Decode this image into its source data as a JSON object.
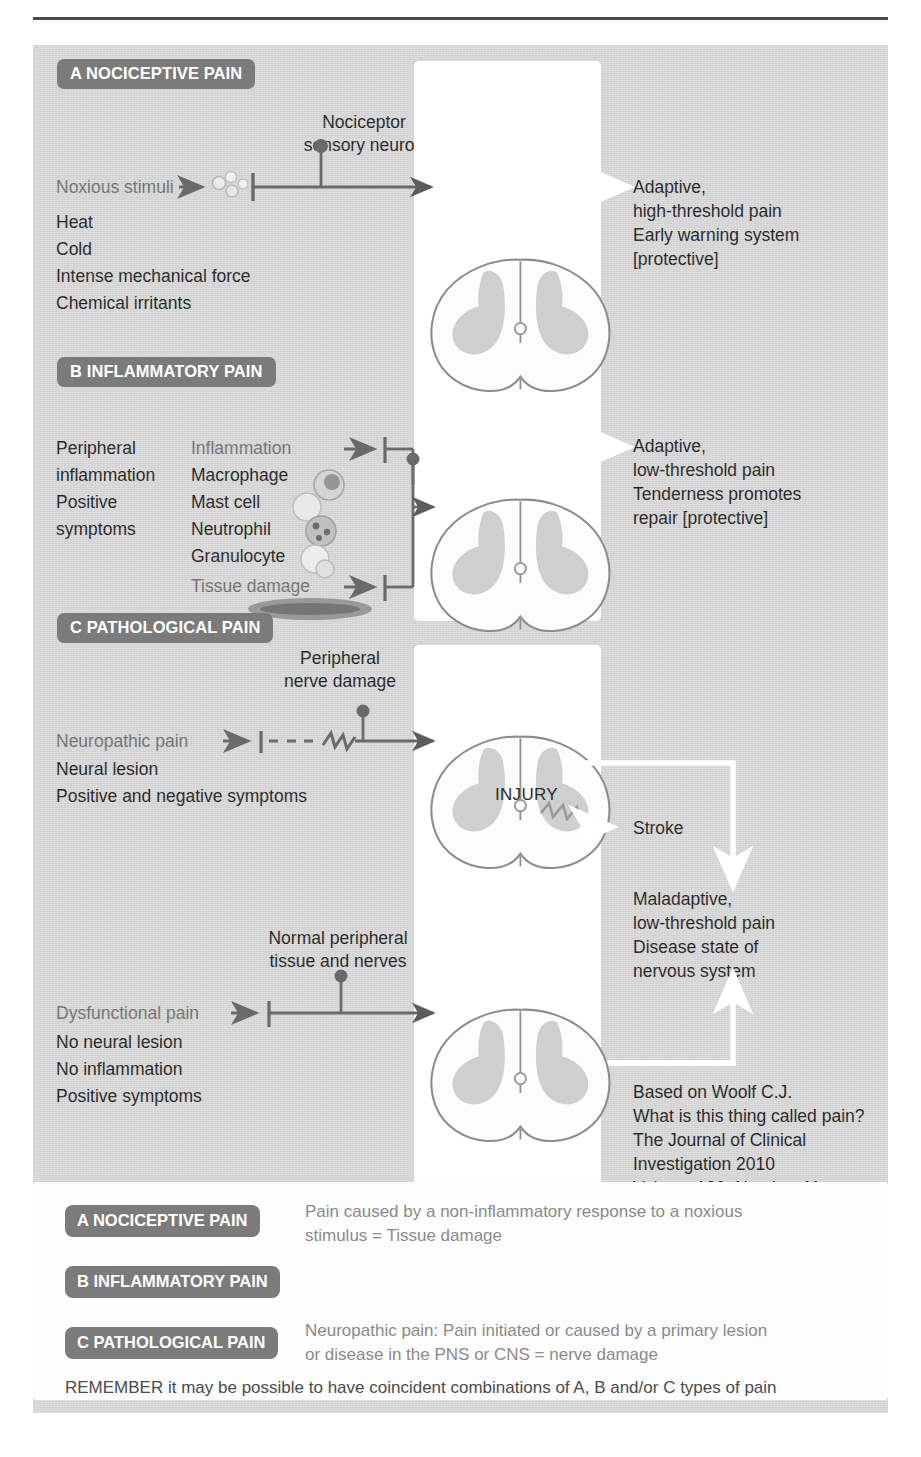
{
  "figure": {
    "title_caption": "Classification of pain mechanisms",
    "accent_pill_color": "#7b7b7b",
    "canvas_color": "#d8d8d8"
  },
  "sections": {
    "a": {
      "pill": "A NOCICEPTIVE PAIN",
      "stimulus_label": "Noxious stimuli",
      "neuron_label_line1": "Nociceptor",
      "neuron_label_line2": "sensory neuron",
      "stimuli_list": [
        "Heat",
        "Cold",
        "Intense mechanical force",
        "Chemical irritants"
      ],
      "cord_title": [
        "Pain",
        "Autonomic response",
        "Withdrawal reflex"
      ],
      "cord_caption": "Spinal cord",
      "outcome": [
        "Adaptive,",
        "high-threshold pain",
        "Early warning system",
        "[protective]"
      ]
    },
    "b": {
      "pill": "B INFLAMMATORY PAIN",
      "left_col": [
        "Peripheral",
        "inflammation",
        "Positive",
        "symptoms"
      ],
      "mid_col": [
        "Inflammation",
        "Macrophage",
        "Mast cell",
        "Neutrophil",
        "Granulocyte",
        "Tissue damage"
      ],
      "mid_col_grey_indices": [
        0,
        5
      ],
      "cord_title": [
        "Spontaneous pain",
        "Pain hypersensitivity"
      ],
      "outcome": [
        "Adaptive,",
        "low-threshold pain",
        "Tenderness promotes",
        "repair [protective]"
      ]
    },
    "c": {
      "pill": "C PATHOLOGICAL PAIN",
      "nerve_label_line1": "Peripheral",
      "nerve_label_line2": "nerve damage",
      "neuropathic_label": "Neuropathic pain",
      "neuropathic_list": [
        "Neural lesion",
        "Positive and negative symptoms"
      ],
      "cord_title": [
        "Spontaneous pain",
        "Pain hypersensitivity"
      ],
      "injury_label": "INJURY",
      "cord_caption": [
        "Abnormal control",
        "processing"
      ],
      "stroke_label": "Stroke",
      "outcome": [
        "Maladaptive,",
        "low-threshold pain",
        "Disease state of",
        "nervous system"
      ]
    },
    "d": {
      "normal_label_line1": "Normal peripheral",
      "normal_label_line2": "tissue and nerves",
      "dysfunctional_label": "Dysfunctional pain",
      "dysfunctional_list": [
        "No neural lesion",
        "No inflammation",
        "Positive symptoms"
      ],
      "cord_title": [
        "Spontaneous pain",
        "Pain hypersensitivity"
      ],
      "cord_caption": [
        "Abnormal control",
        "processing"
      ]
    }
  },
  "citation": [
    "Based on Woolf C.J.",
    "What is this thing called pain?",
    "The Journal of Clinical",
    "Investigation 2010",
    "Volume 120; Number 11:",
    "3742–4 8"
  ],
  "legend": {
    "rows": [
      {
        "pill": "A NOCICEPTIVE PAIN",
        "text": "Pain caused by a non-inflammatory response to a noxious\nstimulus = Tissue damage"
      },
      {
        "pill": "B INFLAMMATORY PAIN",
        "text": ""
      },
      {
        "pill": "C PATHOLOGICAL PAIN",
        "text": "Neuropathic pain: Pain initiated or caused by a primary lesion\nor disease in the PNS or CNS = nerve damage"
      }
    ],
    "remember": "REMEMBER it may be possible to have coincident combinations of A, B and/or C types of pain"
  }
}
